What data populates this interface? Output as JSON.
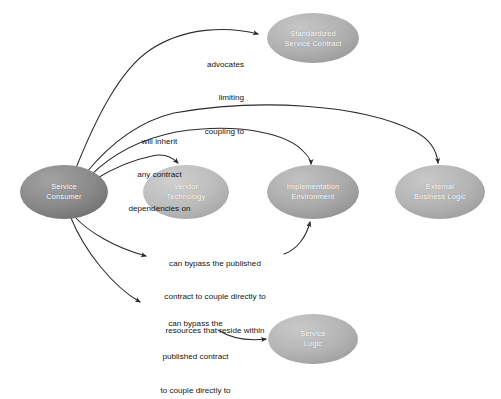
{
  "diagram": {
    "type": "node-edge-diagram",
    "background_color": "#ffffff",
    "text_color": "#141414",
    "node_text_color": "#ffffff",
    "edge_color": "#2b2b2b",
    "nodes": [
      {
        "id": "service-consumer",
        "label_line1": "Service",
        "label_line2": "Consumer",
        "cx": 64,
        "cy": 192,
        "rx": 44,
        "ry": 27,
        "fill_light": "#9a9a9a",
        "fill_dark": "#6d6d6d"
      },
      {
        "id": "vendor-technology",
        "label_line1": "Vendor",
        "label_line2": "Technology",
        "cx": 186,
        "cy": 192,
        "rx": 43,
        "ry": 27,
        "fill_light": "#c3c3c3",
        "fill_dark": "#a3a3a3"
      },
      {
        "id": "implementation-environment",
        "label_line1": "Implementation",
        "label_line2": "Environment",
        "cx": 313,
        "cy": 192,
        "rx": 46,
        "ry": 27,
        "fill_light": "#b4b4b4",
        "fill_dark": "#8f8f8f"
      },
      {
        "id": "external-business-logic",
        "label_line1": "External",
        "label_line2": "Business Logic",
        "cx": 440,
        "cy": 192,
        "rx": 45,
        "ry": 27,
        "fill_light": "#bcbcbc",
        "fill_dark": "#9b9b9b"
      },
      {
        "id": "standardized-service-contract",
        "label_line1": "Standardized",
        "label_line2": "Service Contract",
        "cx": 313,
        "cy": 38,
        "rx": 46,
        "ry": 25,
        "fill_light": "#b9b9b9",
        "fill_dark": "#999999"
      },
      {
        "id": "service-logic",
        "label_line1": "Service",
        "label_line2": "Logic",
        "cx": 313,
        "cy": 339,
        "rx": 45,
        "ry": 25,
        "fill_light": "#bdbdbd",
        "fill_dark": "#9d9d9d"
      }
    ],
    "edge_labels": [
      {
        "id": "advocates-limiting-coupling-to",
        "lines": [
          "advocates",
          "limiting",
          "coupling to"
        ],
        "x": 146,
        "y": 37,
        "width": 98,
        "align": "right"
      },
      {
        "id": "will-inherit-any-contract-dependencies-on",
        "lines": [
          "will inherit",
          "any contract",
          "dependencies on"
        ],
        "x": 107,
        "y": 114,
        "width": 105,
        "align": "center"
      },
      {
        "id": "can-bypass-published-contract-resources",
        "lines": [
          "can bypass the published",
          "contract to couple directly to",
          "resources that reside within"
        ],
        "x": 147,
        "y": 236,
        "width": 136,
        "align": "center"
      },
      {
        "id": "can-bypass-published-contract-couple-directly",
        "lines": [
          "can bypass the",
          "published contract",
          "to couple directly to"
        ],
        "x": 139,
        "y": 296,
        "width": 113,
        "align": "center"
      }
    ],
    "edges": [
      {
        "id": "consumer-to-standardized-service-contract",
        "from": "service-consumer",
        "to": "standardized-service-contract"
      },
      {
        "id": "consumer-to-external-business-logic",
        "from": "service-consumer",
        "to": "external-business-logic"
      },
      {
        "id": "consumer-to-implementation-environment",
        "from": "service-consumer",
        "to": "implementation-environment"
      },
      {
        "id": "consumer-to-vendor-technology",
        "from": "service-consumer",
        "to": "vendor-technology"
      },
      {
        "id": "consumer-to-implementation-environment-bypass",
        "from": "service-consumer",
        "to": "implementation-environment"
      },
      {
        "id": "consumer-to-service-logic",
        "from": "service-consumer",
        "to": "service-logic"
      }
    ]
  }
}
